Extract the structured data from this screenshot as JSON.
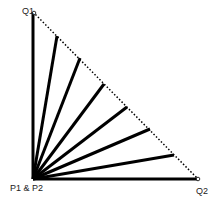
{
  "labels": {
    "q1": "Q1",
    "q2": "Q2",
    "origin": "P1 & P2"
  },
  "diagram": {
    "origin": [
      33,
      179
    ],
    "q1": [
      33,
      12
    ],
    "q2": [
      198,
      179
    ],
    "rays": [
      [
        57,
        36
      ],
      [
        80,
        58
      ],
      [
        104,
        84
      ],
      [
        127,
        107
      ],
      [
        150,
        129
      ],
      [
        174,
        155
      ]
    ],
    "line_color": "#000000"
  }
}
